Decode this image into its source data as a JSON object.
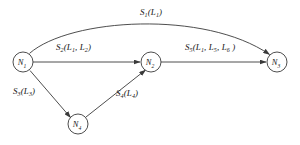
{
  "diagram": {
    "canvas": {
      "width": 300,
      "height": 145,
      "background": "#ffffff"
    },
    "stroke_color": "#3a3a3a",
    "text_color": "#161616",
    "nodes": [
      {
        "id": "N1",
        "name": "N",
        "sub": "1",
        "cx": 23,
        "cy": 62,
        "r": 10
      },
      {
        "id": "N2",
        "name": "N",
        "sub": "2",
        "cx": 151,
        "cy": 62,
        "r": 10
      },
      {
        "id": "N3",
        "name": "N",
        "sub": "3",
        "cx": 277,
        "cy": 62,
        "r": 10
      },
      {
        "id": "N4",
        "name": "N",
        "sub": "4",
        "cx": 78,
        "cy": 124,
        "r": 10
      }
    ],
    "edges": [
      {
        "id": "E1",
        "from": "N1",
        "to": "N3",
        "shape": "curved-arc",
        "label_service": "S",
        "label_service_sub": "1",
        "label_args": "L",
        "label_args_sub": "1",
        "label_text": "S1(L1)"
      },
      {
        "id": "E2",
        "from": "N1",
        "to": "N2",
        "shape": "straight",
        "label_text": "S2(L1, L2)"
      },
      {
        "id": "E3",
        "from": "N1",
        "to": "N4",
        "shape": "straight",
        "label_text": "S3(L3)"
      },
      {
        "id": "E4",
        "from": "N4",
        "to": "N2",
        "shape": "straight",
        "label_text": "S4(L4)"
      },
      {
        "id": "E5",
        "from": "N2",
        "to": "N3",
        "shape": "straight",
        "label_text": "S5(L1, L5, L6)"
      }
    ],
    "labels": {
      "s1": {
        "s": "S",
        "s_sub": "1",
        "open": "(",
        "a1": "L",
        "a1_sub": "1",
        "close": ")"
      },
      "s2": {
        "s": "S",
        "s_sub": "2",
        "open": "(",
        "a1": "L",
        "a1_sub": "1",
        "sep": ", ",
        "a2": "L",
        "a2_sub": "2",
        "close": ")"
      },
      "s3": {
        "s": "S",
        "s_sub": "3",
        "open": "(",
        "a1": "L",
        "a1_sub": "3",
        "close": ")"
      },
      "s4": {
        "s": "S",
        "s_sub": "4",
        "open": "(",
        "a1": "L",
        "a1_sub": "4",
        "close": ")"
      },
      "s5": {
        "s": "S",
        "s_sub": "5",
        "open": "(",
        "a1": "L",
        "a1_sub": "1",
        "sep1": ", ",
        "a2": "L",
        "a2_sub": "5",
        "sep2": ", ",
        "a3": "L",
        "a3_sub": "6",
        "close": " )"
      }
    }
  }
}
